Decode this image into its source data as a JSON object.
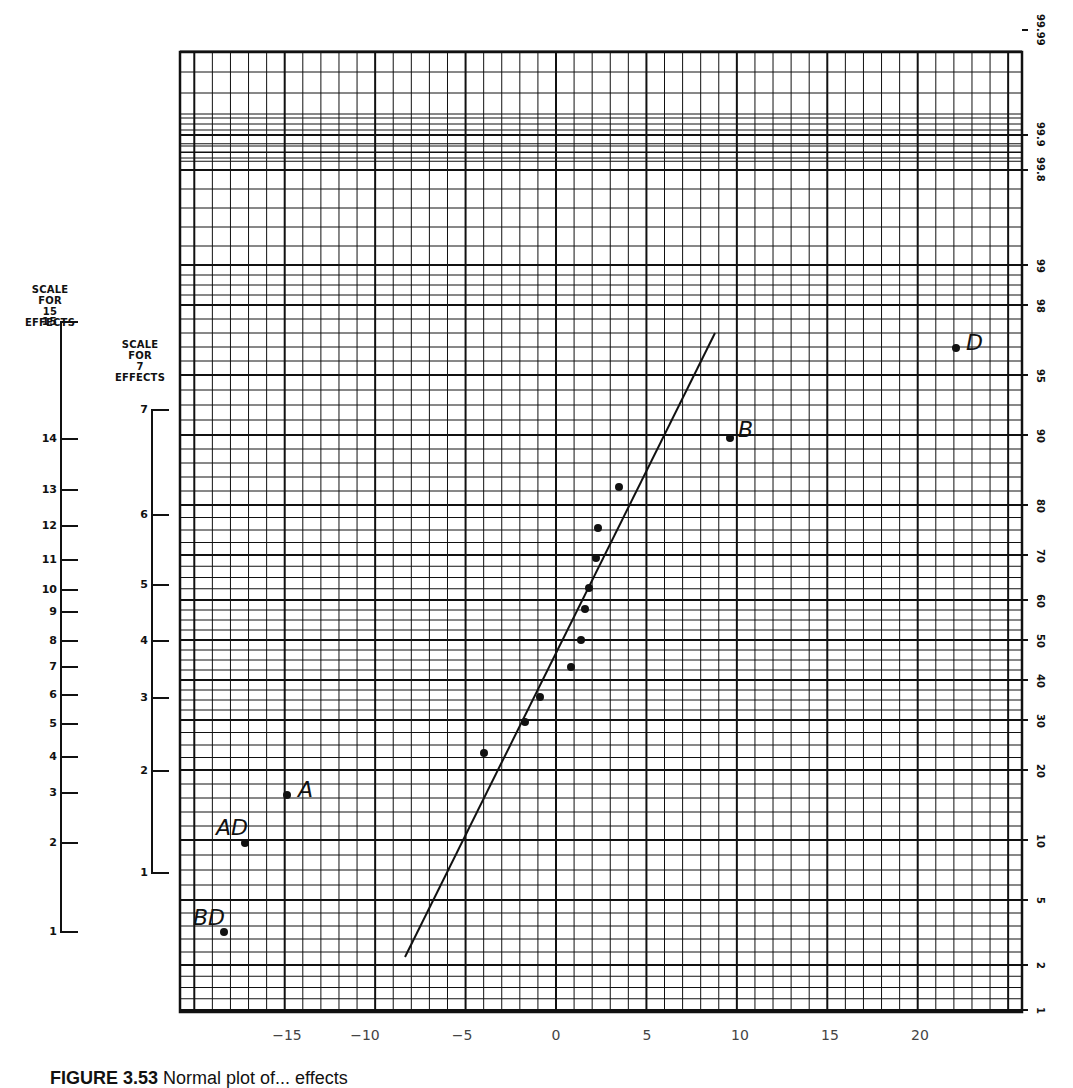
{
  "figure": {
    "caption_label": "FIGURE 3.53",
    "caption_text": "Normal plot of... effects"
  },
  "left_scales": {
    "scale15": {
      "title": [
        "SCALE",
        "FOR",
        "15",
        "EFFECTS"
      ],
      "ticks": [
        {
          "label": "15",
          "y": 322
        },
        {
          "label": "14",
          "y": 439
        },
        {
          "label": "13",
          "y": 490
        },
        {
          "label": "12",
          "y": 526
        },
        {
          "label": "11",
          "y": 560
        },
        {
          "label": "10",
          "y": 590
        },
        {
          "label": "9",
          "y": 612
        },
        {
          "label": "8",
          "y": 641
        },
        {
          "label": "7",
          "y": 667
        },
        {
          "label": "6",
          "y": 695
        },
        {
          "label": "5",
          "y": 724
        },
        {
          "label": "4",
          "y": 757
        },
        {
          "label": "3",
          "y": 793
        },
        {
          "label": "2",
          "y": 843
        },
        {
          "label": "1",
          "y": 932
        }
      ]
    },
    "scale7": {
      "title": [
        "SCALE",
        "FOR",
        "7",
        "EFFECTS"
      ],
      "ticks": [
        {
          "label": "7",
          "y": 410
        },
        {
          "label": "6",
          "y": 515
        },
        {
          "label": "5",
          "y": 585
        },
        {
          "label": "4",
          "y": 641
        },
        {
          "label": "3",
          "y": 698
        },
        {
          "label": "2",
          "y": 771
        },
        {
          "label": "1",
          "y": 873
        }
      ]
    }
  },
  "chart_data": {
    "type": "scatter",
    "xlabel": "Effect",
    "ylabel": "Cumulative probability (%)",
    "x_ticks": [
      -15,
      -10,
      -5,
      0,
      5,
      10,
      15,
      20
    ],
    "xlim": [
      -20.6,
      25
    ],
    "y_ticks_right": [
      "1",
      "2",
      "5",
      "10",
      "20",
      "30",
      "40",
      "50",
      "60",
      "70",
      "80",
      "90",
      "95",
      "98",
      "99",
      "99.8",
      "99.9",
      "99.99"
    ],
    "grid": true,
    "points": [
      {
        "label": "BD",
        "x": -18.0,
        "rank": 1
      },
      {
        "label": "AD",
        "x": -16.8,
        "rank": 2
      },
      {
        "label": "A",
        "x": -14.5,
        "rank": 3
      },
      {
        "label": "",
        "x": -3.9,
        "rank": 4
      },
      {
        "label": "",
        "x": -1.7,
        "rank": 5
      },
      {
        "label": "",
        "x": -0.9,
        "rank": 6
      },
      {
        "label": "",
        "x": 0.8,
        "rank": 7
      },
      {
        "label": "",
        "x": 1.4,
        "rank": 8
      },
      {
        "label": "",
        "x": 1.6,
        "rank": 9
      },
      {
        "label": "",
        "x": 1.8,
        "rank": 10
      },
      {
        "label": "",
        "x": 2.2,
        "rank": 11
      },
      {
        "label": "",
        "x": 2.3,
        "rank": 12
      },
      {
        "label": "",
        "x": 3.4,
        "rank": 13
      },
      {
        "label": "B",
        "x": 9.4,
        "rank": 14
      },
      {
        "label": "D",
        "x": 21.6,
        "rank": 15
      }
    ],
    "reference_line": {
      "x_start": -8.0,
      "p_start": 2.3,
      "x_end": 8.6,
      "p_end": 97
    }
  },
  "plot_px": {
    "grid": {
      "left": 180,
      "top": 52,
      "right": 1022,
      "bottom": 1012
    },
    "x_tick_px": [
      287,
      365,
      462,
      556,
      647,
      740,
      830,
      920
    ],
    "right_tick_px": [
      1010,
      965,
      900,
      840,
      770,
      720,
      680,
      640,
      600,
      555,
      505,
      435,
      375,
      305,
      265,
      170,
      135,
      30
    ],
    "points_px": [
      [
        224,
        932
      ],
      [
        245,
        843
      ],
      [
        287,
        795
      ],
      [
        484,
        753
      ],
      [
        525,
        722
      ],
      [
        540,
        697
      ],
      [
        571,
        667
      ],
      [
        581,
        640
      ],
      [
        585,
        609
      ],
      [
        589,
        588
      ],
      [
        596,
        558
      ],
      [
        598,
        528
      ],
      [
        619,
        487
      ],
      [
        730,
        438
      ],
      [
        956,
        348
      ]
    ],
    "labels_px": [
      {
        "text": "BD",
        "x": 193,
        "y": 925
      },
      {
        "text": "AD",
        "x": 216,
        "y": 835
      },
      {
        "text": "A",
        "x": 298,
        "y": 797
      },
      {
        "text": "B",
        "x": 738,
        "y": 437
      },
      {
        "text": "D",
        "x": 966,
        "y": 350
      }
    ],
    "line_px": [
      [
        405,
        957
      ],
      [
        715,
        333
      ]
    ]
  }
}
